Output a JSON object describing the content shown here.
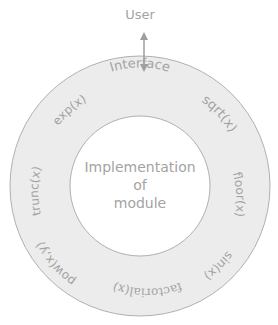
{
  "diagram": {
    "user_label": "User",
    "interface_label": "Interface",
    "center_lines": [
      "Implementation",
      "of",
      "module"
    ],
    "functions": {
      "sqrt": "sqrt(x)",
      "floor": "floor(x)",
      "sin": "sin(x)",
      "factorial": "factorial(x)",
      "pow": "pow(x,y)",
      "trunc": "trunc(x)",
      "exp": "exp(x)"
    },
    "colors": {
      "ring_fill": "#ececec",
      "ring_stroke": "#b0b0b0",
      "text": "#a3a3a3",
      "arrow": "#9e9e9e"
    }
  }
}
